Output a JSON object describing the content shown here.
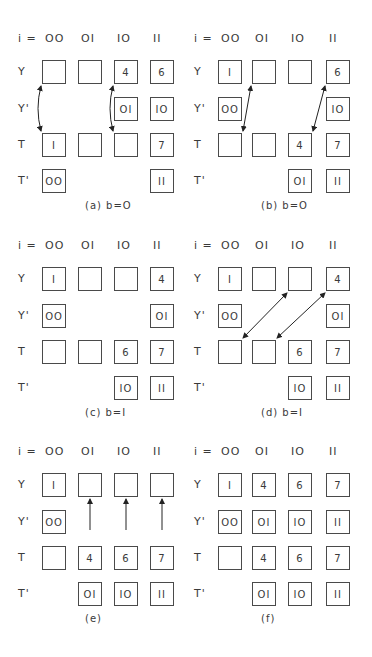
{
  "figure": {
    "column_label_prefix": "i =",
    "columns": [
      "OO",
      "OI",
      "IO",
      "II"
    ],
    "row_labels": [
      "Y",
      "Y'",
      "T",
      "T'"
    ]
  },
  "panels": [
    {
      "id": "a",
      "caption": "(a) b=O",
      "cells": {
        "Y": [
          "",
          "",
          "4",
          "6"
        ],
        "Y'": [
          null,
          null,
          "OI",
          "IO"
        ],
        "T": [
          "I",
          "",
          "",
          "7"
        ],
        "T'": [
          "OO",
          null,
          null,
          "II"
        ]
      },
      "arrows": [
        {
          "type": "double-curved",
          "from": "Y[00]",
          "to": "T[00]"
        },
        {
          "type": "double-curved",
          "from": "Y[10]",
          "to": "T[10]"
        }
      ]
    },
    {
      "id": "b",
      "caption": "(b) b=O",
      "cells": {
        "Y": [
          "I",
          "",
          "",
          "6"
        ],
        "Y'": [
          "OO",
          null,
          null,
          "IO"
        ],
        "T": [
          "",
          "",
          "4",
          "7"
        ],
        "T'": [
          null,
          null,
          "OI",
          "II"
        ]
      },
      "arrows": [
        {
          "type": "double",
          "from": "Y[01]",
          "to": "T[00]"
        },
        {
          "type": "double",
          "from": "Y[11]",
          "to": "T[10]"
        }
      ]
    },
    {
      "id": "c",
      "caption": "(c) b=I",
      "cells": {
        "Y": [
          "I",
          "",
          "",
          "4"
        ],
        "Y'": [
          "OO",
          null,
          null,
          "OI"
        ],
        "T": [
          "",
          "",
          "6",
          "7"
        ],
        "T'": [
          null,
          null,
          "IO",
          "II"
        ]
      },
      "arrows": []
    },
    {
      "id": "d",
      "caption": "(d) b=I",
      "cells": {
        "Y": [
          "I",
          "",
          "",
          "4"
        ],
        "Y'": [
          "OO",
          null,
          null,
          "OI"
        ],
        "T": [
          "",
          "",
          "6",
          "7"
        ],
        "T'": [
          null,
          null,
          "IO",
          "II"
        ]
      },
      "arrows": [
        {
          "type": "double",
          "from": "Y[10]",
          "to": "T[00]"
        },
        {
          "type": "double",
          "from": "Y[11]",
          "to": "T[01]"
        }
      ]
    },
    {
      "id": "e",
      "caption": "(e)",
      "cells": {
        "Y": [
          "I",
          "",
          "",
          ""
        ],
        "Y'": [
          "OO",
          null,
          null,
          null
        ],
        "T": [
          "",
          "4",
          "6",
          "7"
        ],
        "T'": [
          null,
          "OI",
          "IO",
          "II"
        ]
      },
      "arrows": [
        {
          "type": "single-up",
          "from": "T[01]",
          "to": "Y[01]"
        },
        {
          "type": "single-up",
          "from": "T[10]",
          "to": "Y[10]"
        },
        {
          "type": "single-up",
          "from": "T[11]",
          "to": "Y[11]"
        }
      ]
    },
    {
      "id": "f",
      "caption": "(f)",
      "cells": {
        "Y": [
          "I",
          "4",
          "6",
          "7"
        ],
        "Y'": [
          "OO",
          "OI",
          "IO",
          "II"
        ],
        "T": [
          "",
          "4",
          "6",
          "7"
        ],
        "T'": [
          null,
          "OI",
          "IO",
          "II"
        ]
      },
      "arrows": []
    }
  ]
}
